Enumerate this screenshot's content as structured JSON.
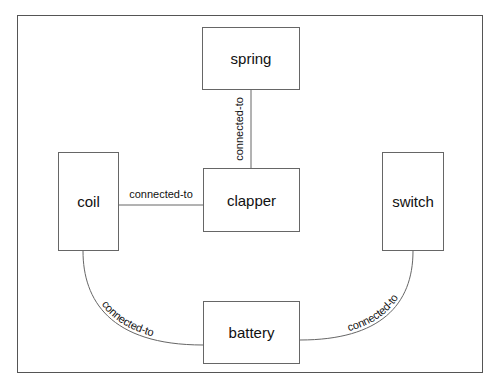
{
  "diagram": {
    "nodes": [
      {
        "id": "spring",
        "label": "spring"
      },
      {
        "id": "clapper",
        "label": "clapper"
      },
      {
        "id": "coil",
        "label": "coil"
      },
      {
        "id": "switch",
        "label": "switch"
      },
      {
        "id": "battery",
        "label": "battery"
      }
    ],
    "edges": [
      {
        "from": "spring",
        "to": "clapper",
        "label": "connected-to"
      },
      {
        "from": "coil",
        "to": "clapper",
        "label": "connected-to"
      },
      {
        "from": "coil",
        "to": "battery",
        "label": "connected-to"
      },
      {
        "from": "battery",
        "to": "switch",
        "label": "connected-to"
      }
    ]
  }
}
